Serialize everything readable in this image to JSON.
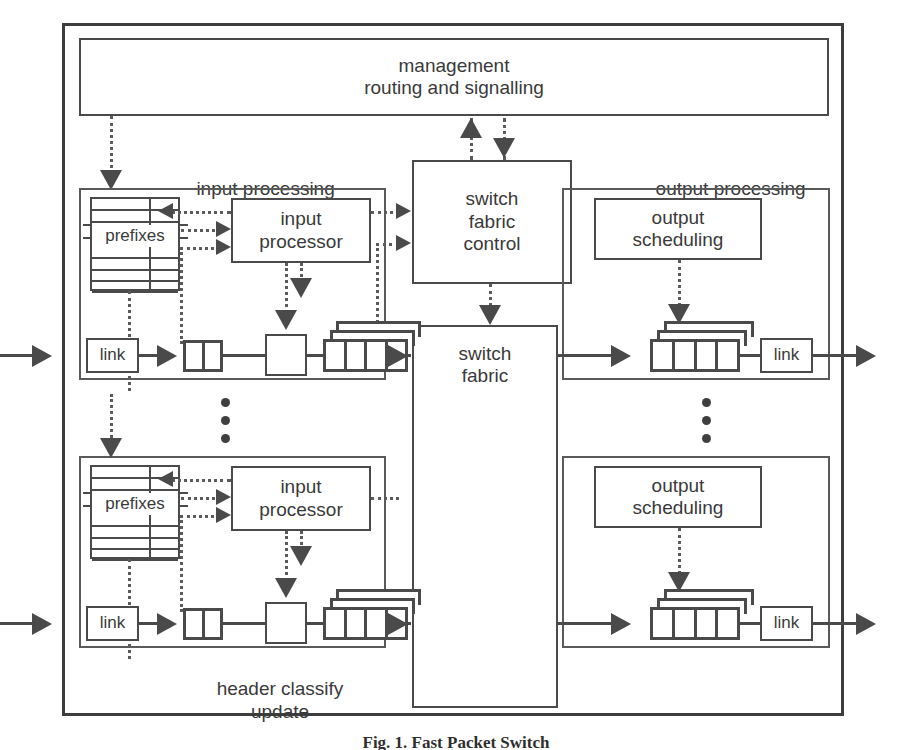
{
  "figure": {
    "caption": "Fig. 1.  Fast Packet Switch",
    "outer_label": ""
  },
  "blocks": {
    "management": "management\nrouting and signalling",
    "switch_fabric_control": "switch\nfabric\ncontrol",
    "switch_fabric": "switch\nfabric"
  },
  "section_labels": {
    "input_processing": "input processing",
    "output_processing": "output processing",
    "header_classify_update": "header  classify\nupdate"
  },
  "input_rows": [
    {
      "prefixes": "prefixes",
      "processor": "input\nprocessor",
      "link": "link",
      "queue_cells": 2,
      "out_queue_cells": 4,
      "out_queue_layers": 3
    },
    {
      "prefixes": "prefixes",
      "processor": "input\nprocessor",
      "link": "link",
      "queue_cells": 2,
      "out_queue_cells": 4,
      "out_queue_layers": 3
    }
  ],
  "output_rows": [
    {
      "scheduling": "output\nscheduling",
      "link": "link",
      "queue_cells": 4,
      "queue_layers": 3
    },
    {
      "scheduling": "output\nscheduling",
      "link": "link",
      "queue_cells": 4,
      "queue_layers": 3
    }
  ],
  "ellipsis": {
    "input_dots": 3,
    "output_dots": 3
  },
  "colors": {
    "stroke": "#4a4a4a",
    "dotted": "#5b5b5b",
    "text": "#3a3a3a",
    "background": "#ffffff"
  },
  "prefixes_table": {
    "rows": 8,
    "label_row_index": 2
  }
}
